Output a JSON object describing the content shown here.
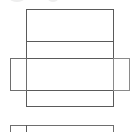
{
  "diagram": {
    "type": "box-net",
    "stroke_color": "#5a5a5a",
    "flap_stroke_color": "#6e6e6e",
    "background": "#ffffff",
    "main_column": {
      "x": 26,
      "y": 9,
      "width": 87,
      "height": 97
    },
    "dividers_y": [
      41,
      58,
      90
    ],
    "left_flap": {
      "x": 10,
      "y": 58,
      "width": 16,
      "height": 32
    },
    "right_flap": {
      "x": 113,
      "y": 58,
      "width": 16,
      "height": 32
    },
    "partial_shape_bottom": {
      "x": 10,
      "y": 125,
      "width": 103,
      "divider_x": 26
    }
  }
}
